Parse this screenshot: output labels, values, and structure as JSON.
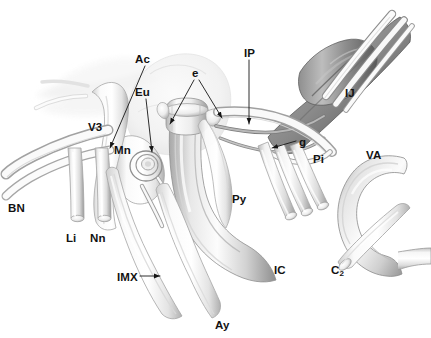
{
  "figure": {
    "type": "anatomical-illustration",
    "style": "grayscale airbrush medical illustration",
    "background_color": "#ffffff",
    "label_color": "#121212",
    "leader_line_color": "#1a1a1a"
  },
  "labels": [
    {
      "id": "BN",
      "text": "BN",
      "x": 8,
      "y": 203,
      "description": "buccal nerve"
    },
    {
      "id": "Li",
      "text": "Li",
      "x": 66,
      "y": 233,
      "description": "lingual nerve"
    },
    {
      "id": "Nn",
      "text": "Nn",
      "x": 90,
      "y": 233,
      "description": "inferior alveolar nerve"
    },
    {
      "id": "V3",
      "text": "V3",
      "x": 88,
      "y": 122,
      "description": "mandibular division of trigeminal nerve"
    },
    {
      "id": "Mn",
      "text": "Mn",
      "x": 114,
      "y": 145,
      "description": "mandibular nerve trunk"
    },
    {
      "id": "Ac",
      "text": "Ac",
      "x": 135,
      "y": 54,
      "description": "auriculotemporal / accessory structure"
    },
    {
      "id": "Eu",
      "text": "Eu",
      "x": 135,
      "y": 87,
      "description": "eustachian tube"
    },
    {
      "id": "e",
      "text": "e",
      "x": 192,
      "y": 68,
      "description": "eustachian tube orifice / cartilage edges"
    },
    {
      "id": "IP",
      "text": "IP",
      "x": 244,
      "y": 48,
      "description": "inferior petrosal sinus"
    },
    {
      "id": "IJ",
      "text": "IJ",
      "x": 345,
      "y": 88,
      "description": "internal jugular vein"
    },
    {
      "id": "g",
      "text": "g",
      "x": 299,
      "y": 137,
      "description": "glossopharyngeal nerve"
    },
    {
      "id": "Pi",
      "text": "Pi",
      "x": 313,
      "y": 154,
      "description": "pharyngeal branch"
    },
    {
      "id": "VA",
      "text": "VA",
      "x": 366,
      "y": 150,
      "description": "vertebral artery"
    },
    {
      "id": "Py",
      "text": "Py",
      "x": 232,
      "y": 194,
      "description": "pharyngeal wall"
    },
    {
      "id": "IC",
      "text": "IC",
      "x": 274,
      "y": 265,
      "description": "internal carotid artery"
    },
    {
      "id": "C",
      "text": "C",
      "sub": "2",
      "x": 331,
      "y": 265,
      "description": "second cervical nerve root"
    },
    {
      "id": "IMX",
      "text": "IMX",
      "x": 117,
      "y": 272,
      "description": "internal maxillary artery"
    },
    {
      "id": "Ay",
      "text": "Ay",
      "x": 215,
      "y": 320,
      "description": "ascending pharyngeal artery"
    }
  ],
  "structures": [
    {
      "id": "ij-vein",
      "name": "internal jugular vein",
      "tone": "dark-gray"
    },
    {
      "id": "ic-artery",
      "name": "internal carotid artery",
      "tone": "mid-gray"
    },
    {
      "id": "va-artery",
      "name": "vertebral artery arch",
      "tone": "mid-gray"
    },
    {
      "id": "c2-root",
      "name": "C2 nerve root",
      "tone": "light-gray"
    },
    {
      "id": "eustachian",
      "name": "eustachian tube",
      "tone": "light-gray"
    },
    {
      "id": "mandibular-nerve",
      "name": "V3 mandibular nerve",
      "tone": "light-gray"
    },
    {
      "id": "skull-ghost",
      "name": "ghosted skull base outline",
      "tone": "very-light-gray"
    },
    {
      "id": "cut-nerves",
      "name": "three cut lower cranial nerves",
      "tone": "light-gray"
    }
  ]
}
